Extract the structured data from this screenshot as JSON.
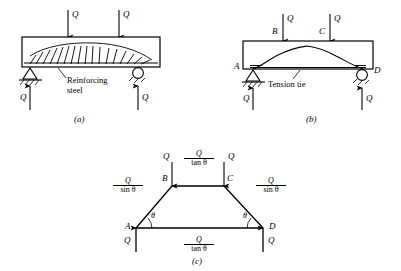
{
  "figure": {
    "stroke_color": "#000000",
    "background_color": "#ffffff"
  },
  "panels": [
    {
      "caption": "(a)",
      "description": "Reinforced concrete beam with two point loads and reinforcing steel",
      "annotation": {
        "line1": "Reinforcing",
        "line2": "steel"
      },
      "loads": [
        {
          "label": "Q",
          "direction": "down"
        },
        {
          "label": "Q",
          "direction": "down"
        }
      ],
      "reactions": [
        {
          "label": "Q",
          "direction": "up",
          "support": "pin"
        },
        {
          "label": "Q",
          "direction": "up",
          "support": "roller"
        }
      ]
    },
    {
      "caption": "(b)",
      "description": "Arch action with tension tie between supports",
      "annotation": {
        "line1": "Tension tie"
      },
      "nodes": [
        {
          "label": "A"
        },
        {
          "label": "B"
        },
        {
          "label": "C"
        },
        {
          "label": "D"
        }
      ],
      "loads": [
        {
          "label": "Q",
          "direction": "down",
          "at": "B"
        },
        {
          "label": "Q",
          "direction": "down",
          "at": "C"
        }
      ],
      "reactions": [
        {
          "label": "Q",
          "direction": "up",
          "support": "pin",
          "at": "A"
        },
        {
          "label": "Q",
          "direction": "up",
          "support": "roller",
          "at": "D"
        }
      ]
    },
    {
      "caption": "(c)",
      "description": "Equivalent truss with member forces",
      "nodes": [
        {
          "label": "A"
        },
        {
          "label": "B"
        },
        {
          "label": "C"
        },
        {
          "label": "D"
        }
      ],
      "angles": [
        {
          "label": "θ",
          "at": "A"
        },
        {
          "label": "θ",
          "at": "D"
        }
      ],
      "loads": [
        {
          "label": "Q",
          "direction": "down",
          "at": "B"
        },
        {
          "label": "Q",
          "direction": "down",
          "at": "C"
        }
      ],
      "reactions": [
        {
          "label": "Q",
          "direction": "up",
          "at": "A"
        },
        {
          "label": "Q",
          "direction": "up",
          "at": "D"
        }
      ],
      "member_forces": [
        {
          "member": "AB",
          "numerator": "Q",
          "denominator": "sin θ",
          "denom_fn": "sin",
          "denom_var": "θ"
        },
        {
          "member": "BC",
          "numerator": "Q",
          "denominator": "tan θ",
          "denom_fn": "tan",
          "denom_var": "θ"
        },
        {
          "member": "CD",
          "numerator": "Q",
          "denominator": "sin θ",
          "denom_fn": "sin",
          "denom_var": "θ"
        },
        {
          "member": "AD",
          "numerator": "Q",
          "denominator": "tan θ",
          "denom_fn": "tan",
          "denom_var": "θ"
        }
      ]
    }
  ],
  "captions": {
    "a": "(a)",
    "b": "(b)",
    "c": "(c)"
  },
  "symbols": {
    "Q": "Q",
    "theta": "θ",
    "A": "A",
    "B": "B",
    "C": "C",
    "D": "D",
    "sin": "sin",
    "tan": "tan"
  }
}
